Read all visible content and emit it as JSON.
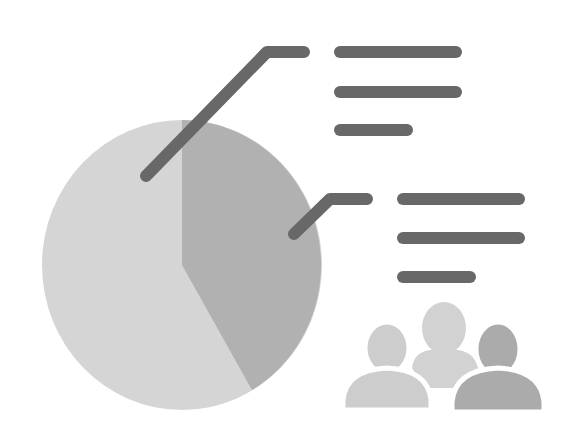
{
  "illustration": {
    "subject": "pie chart with callouts and group of people",
    "colors": {
      "background": "#ffffff",
      "pie_large_slice": "#d5d5d5",
      "pie_small_slice": "#b1b1b1",
      "callout_lines": "#686868",
      "person_left": "#cdcdcd",
      "person_middle": "#d2d2d2",
      "person_right": "#ababab"
    },
    "pie": {
      "cx": 182,
      "cy": 265,
      "rx": 140,
      "ry": 145,
      "slices": [
        {
          "name": "large-slice",
          "share_pct": 64
        },
        {
          "name": "small-slice",
          "share_pct": 36
        }
      ]
    },
    "callouts": [
      {
        "name": "callout-top",
        "leader": [
          [
            146,
            176
          ],
          [
            267,
            52
          ],
          [
            304,
            52
          ]
        ],
        "text_lines": [
          {
            "x1": 340,
            "x2": 456,
            "y": 52
          },
          {
            "x1": 340,
            "x2": 456,
            "y": 92
          },
          {
            "x1": 340,
            "x2": 407,
            "y": 130
          }
        ]
      },
      {
        "name": "callout-right",
        "leader": [
          [
            294,
            234
          ],
          [
            330,
            199
          ],
          [
            367,
            199
          ]
        ],
        "text_lines": [
          {
            "x1": 403,
            "x2": 519,
            "y": 199
          },
          {
            "x1": 403,
            "x2": 519,
            "y": 238
          },
          {
            "x1": 403,
            "x2": 470,
            "y": 277
          }
        ]
      }
    ]
  }
}
